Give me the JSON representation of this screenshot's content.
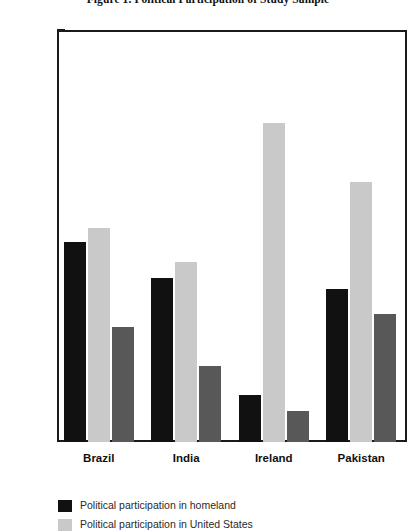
{
  "chart_data": {
    "type": "bar",
    "title": "Figure 1. Political Participation of Study Sample",
    "xlabel": "",
    "ylabel": "",
    "categories": [
      "Brazil",
      "India",
      "Ireland",
      "Pakistan"
    ],
    "series": [
      {
        "name": "Political participation in homeland",
        "color": "#111111",
        "values": [
          24.3,
          19.9,
          5.7,
          18.6
        ]
      },
      {
        "name": "Political participation in United States",
        "color": "#c9c9c9",
        "values": [
          26.0,
          21.8,
          38.7,
          31.6
        ]
      },
      {
        "name": "",
        "color": "#585858",
        "values": [
          13.9,
          9.2,
          3.8,
          15.5
        ]
      }
    ],
    "y_ticks": [
      {
        "label": "60%",
        "value": 60
      },
      {
        "label": "50%",
        "value": 50
      },
      {
        "label": "40%",
        "value": 40
      },
      {
        "label": "35%",
        "value": 35
      },
      {
        "label": "30%",
        "value": 30
      },
      {
        "label": "25%",
        "value": 25
      },
      {
        "label": "20%",
        "value": 20
      },
      {
        "label": "15%",
        "value": 15
      },
      {
        "label": "10%",
        "value": 10
      },
      {
        "label": "5%",
        "value": 5
      },
      {
        "label": "0%",
        "value": 0
      }
    ],
    "ylim": [
      0,
      60
    ],
    "grid": false,
    "legend_position": "bottom-left"
  }
}
